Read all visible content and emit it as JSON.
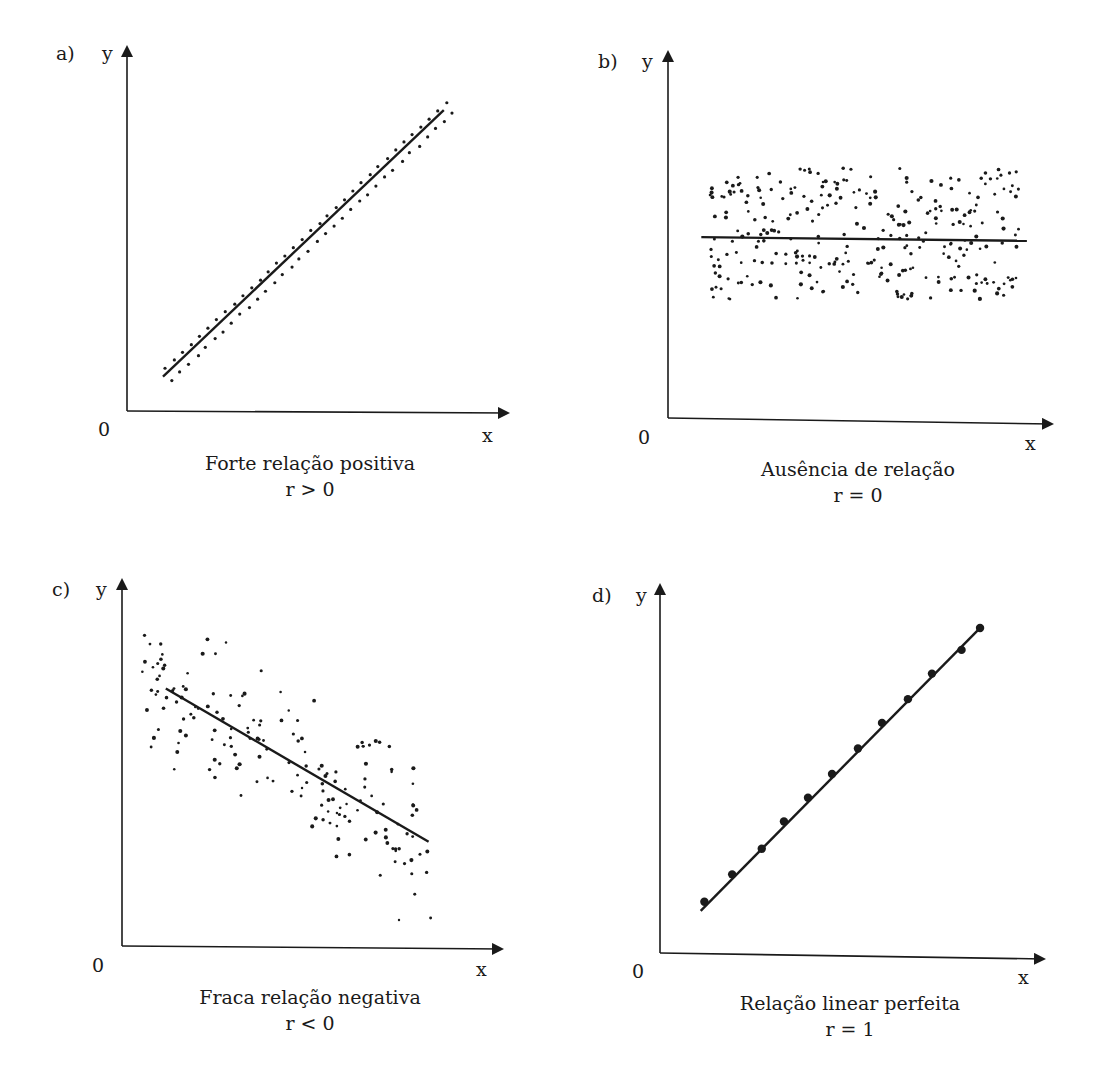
{
  "colors": {
    "ink": "#1a1a1a",
    "background": "#ffffff"
  },
  "panels": [
    {
      "id": "a",
      "panel_label": "a)",
      "y_label": "y",
      "x_label": "x",
      "origin_label": "0",
      "title": "Forte relação positiva",
      "r_label": "r > 0"
    },
    {
      "id": "b",
      "panel_label": "b)",
      "y_label": "y",
      "x_label": "x",
      "origin_label": "0",
      "title": "Ausência de relação",
      "r_label": "r = 0"
    },
    {
      "id": "c",
      "panel_label": "c)",
      "y_label": "y",
      "x_label": "x",
      "origin_label": "0",
      "title": "Fraca relação negativa",
      "r_label": "r < 0"
    },
    {
      "id": "d",
      "panel_label": "d)",
      "y_label": "y",
      "x_label": "x",
      "origin_label": "0",
      "title": "Relação linear perfeita",
      "r_label": "r = 1"
    }
  ],
  "chart_data": [
    {
      "type": "scatter",
      "panel": "a",
      "title": "Forte relação positiva",
      "subtitle": "r > 0",
      "xlabel": "x",
      "ylabel": "y",
      "grid": false,
      "legend": null,
      "correlation": "strong positive",
      "fit_line": {
        "x0": 0.1,
        "y0": 0.09,
        "x1": 0.88,
        "y1": 0.83
      },
      "points_description": "two parallel rows of ~34 dots each, tightly hugging the fit line on both sides",
      "point_count": 68,
      "spread": 0.025
    },
    {
      "type": "scatter",
      "panel": "b",
      "title": "Ausência de relação",
      "subtitle": "r = 0",
      "xlabel": "x",
      "ylabel": "y",
      "grid": false,
      "legend": null,
      "correlation": "none",
      "fit_line": {
        "x0": 0.09,
        "y0": 0.49,
        "x1": 0.97,
        "y1": 0.48
      },
      "points_description": "uniform cloud of ~300 dots in a horizontal band",
      "point_count": 300,
      "x_range": [
        0.11,
        0.95
      ],
      "y_range": [
        0.32,
        0.68
      ]
    },
    {
      "type": "scatter",
      "panel": "c",
      "title": "Fraca relação negativa",
      "subtitle": "r < 0",
      "xlabel": "x",
      "ylabel": "y",
      "grid": false,
      "legend": null,
      "correlation": "weak negative",
      "fit_line": {
        "x0": 0.12,
        "y0": 0.7,
        "x1": 0.84,
        "y1": 0.28
      },
      "points_description": "~170 widely scattered dots in a tilted elliptical cloud around a descending line, one outlier near bottom right",
      "point_count": 170,
      "spread": 0.14
    },
    {
      "type": "scatter",
      "panel": "d",
      "title": "Relação linear perfeita",
      "subtitle": "r = 1",
      "xlabel": "x",
      "ylabel": "y",
      "grid": false,
      "legend": null,
      "correlation": "perfect positive",
      "fit_line": {
        "x0": 0.11,
        "y0": 0.11,
        "x1": 0.87,
        "y1": 0.89
      },
      "x": [
        0.12,
        0.195,
        0.275,
        0.335,
        0.4,
        0.465,
        0.535,
        0.6,
        0.67,
        0.735,
        0.815,
        0.865
      ],
      "y": [
        0.135,
        0.21,
        0.28,
        0.355,
        0.42,
        0.485,
        0.555,
        0.625,
        0.69,
        0.76,
        0.825,
        0.885
      ]
    }
  ]
}
